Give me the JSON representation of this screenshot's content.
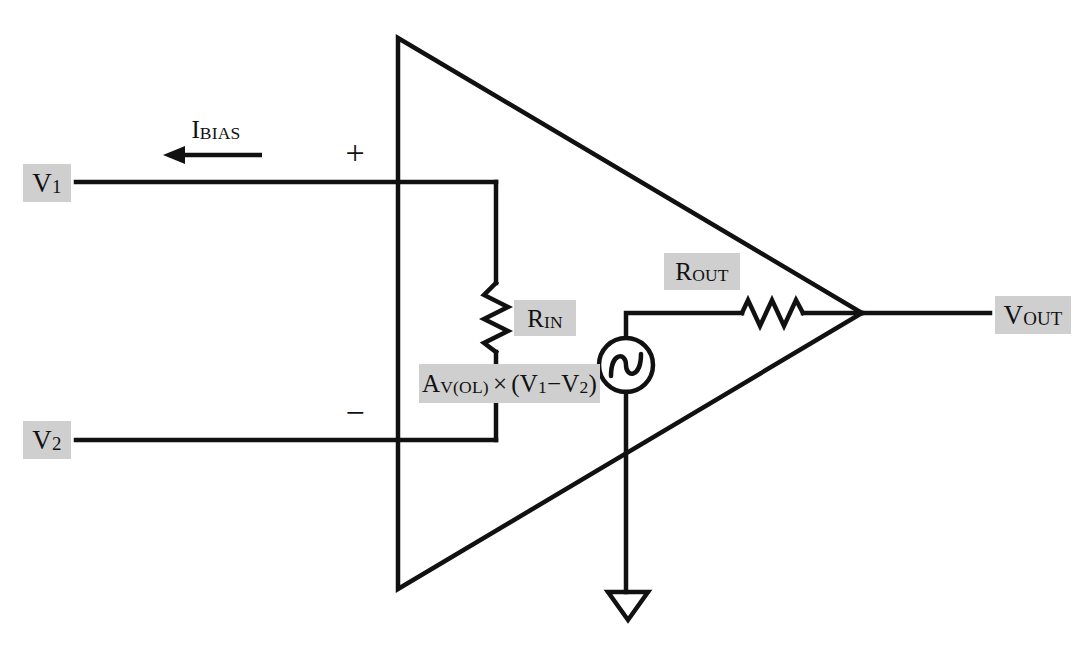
{
  "diagram": {
    "background_color": "#ffffff",
    "line_color": "#111111",
    "label_background_color": "#cfcfcf",
    "label_text_color": "#111111"
  },
  "labels": {
    "v1": {
      "base": "V",
      "sub": "1"
    },
    "v2": {
      "base": "V",
      "sub": "2"
    },
    "vout": {
      "base": "V",
      "sub": "OUT"
    },
    "rin": {
      "base": "R",
      "sub": "IN"
    },
    "rout": {
      "base": "R",
      "sub": "OUT"
    },
    "ibias": {
      "base": "I",
      "sub": "BIAS"
    },
    "gain_expression": "Aᴠ₍ₒₗ₎ × (V₁−V₂)",
    "gain_parts": {
      "a": "A",
      "a_sub": "V(OL)",
      "times": "×",
      "open_paren": "(",
      "v1": "V",
      "v1_sub": "1",
      "minus": "−",
      "v2": "V",
      "v2_sub": "2",
      "close_paren": ")"
    },
    "plus_terminal": "+",
    "minus_terminal": "−"
  },
  "components": {
    "amplifier_triangle": {
      "name": "op-amp-body",
      "points": "398,38 398,589 862,313"
    },
    "input_resistor": {
      "name": "R_IN",
      "orientation": "vertical",
      "label": "R_IN"
    },
    "output_resistor": {
      "name": "R_OUT",
      "orientation": "horizontal",
      "label": "R_OUT"
    },
    "dependent_source": {
      "name": "controlled-voltage-source",
      "symbol": "sine",
      "label": "A_V(OL) x (V1 - V2)"
    },
    "ground": {
      "name": "ground",
      "symbol": "open-triangle"
    },
    "bias_current_arrow": {
      "name": "I_BIAS",
      "direction": "left"
    }
  }
}
